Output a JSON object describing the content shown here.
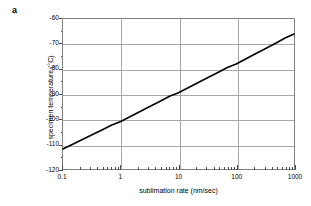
{
  "panel": {
    "label": "a"
  },
  "chart_data": {
    "type": "line",
    "title": "",
    "xlabel": "sublimation rate (nm/sec)",
    "ylabel": "specimen temperature (°C)",
    "xscale": "log",
    "yscale": "linear",
    "xlim": [
      0.1,
      1000
    ],
    "ylim": [
      -120,
      -60
    ],
    "grid": true,
    "legend": "none",
    "xticks": [
      0.1,
      1,
      10,
      100,
      1000
    ],
    "xtick_labels": [
      "0.1",
      "1",
      "10",
      "100",
      "1000"
    ],
    "yticks": [
      -60,
      -70,
      -80,
      -90,
      -100,
      -110,
      -120
    ],
    "ytick_labels": [
      "-60",
      "-70",
      "-80",
      "-90",
      "-100",
      "-110",
      "-120"
    ],
    "series": [
      {
        "name": "sublimation curve",
        "color": "#000000",
        "x": [
          0.1,
          0.2,
          0.3,
          0.5,
          0.7,
          1,
          2,
          3,
          5,
          7,
          10,
          20,
          30,
          50,
          70,
          100,
          200,
          300,
          500,
          700,
          1000
        ],
        "y": [
          -112.0,
          -108.6,
          -106.6,
          -104.1,
          -102.4,
          -101.0,
          -97.4,
          -95.3,
          -92.7,
          -90.9,
          -89.5,
          -85.9,
          -83.8,
          -81.2,
          -79.4,
          -78.0,
          -74.3,
          -72.2,
          -69.5,
          -67.6,
          -66.0
        ]
      }
    ],
    "annotations": []
  }
}
